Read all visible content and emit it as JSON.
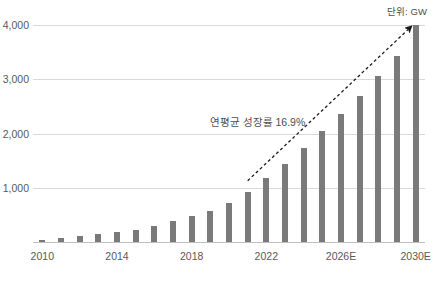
{
  "unit_note": "단위: GW",
  "annotation": {
    "cagr_label": "연평균 성장률 16.9%"
  },
  "axis": {
    "y_ticks": [
      "1,000",
      "2,000",
      "3,000",
      "4,000"
    ],
    "x_ticks": [
      "2010",
      "2014",
      "2018",
      "2022",
      "2026E",
      "2030E"
    ]
  },
  "colors": {
    "bar": "#7a7a7a",
    "grid": "#d9d9d9",
    "axis": "#bfbfbf",
    "text": "#595959",
    "trend": "#1a1a1a"
  },
  "chart_data": {
    "type": "bar",
    "title": "",
    "subtitle": "",
    "xlabel": "",
    "ylabel": "",
    "unit": "GW",
    "grid": true,
    "legend": "none",
    "ylim": [
      0,
      4000
    ],
    "ytick_values": [
      1000,
      2000,
      3000,
      4000
    ],
    "categories": [
      "2010",
      "2011",
      "2012",
      "2013",
      "2014",
      "2015",
      "2016",
      "2017",
      "2018",
      "2019",
      "2020",
      "2021",
      "2022",
      "2023",
      "2024",
      "2025E",
      "2026E",
      "2027E",
      "2028E",
      "2029E",
      "2030E"
    ],
    "xtick_labels": [
      "2010",
      "2014",
      "2018",
      "2022",
      "2026E",
      "2030E"
    ],
    "values": [
      40,
      70,
      105,
      140,
      180,
      230,
      300,
      390,
      480,
      570,
      720,
      930,
      1180,
      1440,
      1740,
      2050,
      2360,
      2700,
      3060,
      3430,
      4000
    ],
    "annotations": [
      {
        "text": "연평균 성장률 16.9%",
        "x": "2021",
        "y": 2250
      },
      {
        "text": "단위: GW",
        "x": "2030E",
        "y": 4250
      }
    ],
    "trend_arrow": {
      "from": [
        "2021",
        1130
      ],
      "to": [
        "2030E",
        4020
      ],
      "style": "dashed",
      "arrowhead": true
    }
  }
}
